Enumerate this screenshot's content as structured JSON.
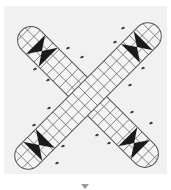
{
  "board": {
    "type": "cross-shaped race board",
    "background_color": "#f1f1f1",
    "grid_line_color": "#6b6b6b",
    "mark_color": "#1a1a1a",
    "arms": [
      {
        "name": "diagonal-tl-br",
        "cx": 88,
        "cy": 97,
        "angle": 45,
        "length": 188,
        "width": 27,
        "rows": 3,
        "cells_per_row": 20
      },
      {
        "name": "diagonal-tr-bl",
        "cx": 88,
        "cy": 96,
        "angle": -45,
        "length": 196,
        "width": 27,
        "rows": 3,
        "cells_per_row": 21
      }
    ],
    "hourglass_markers": [
      {
        "arm": 0,
        "position": "top-left-end"
      },
      {
        "arm": 0,
        "position": "bottom-right-end"
      },
      {
        "arm": 1,
        "position": "top-right-end"
      },
      {
        "arm": 1,
        "position": "bottom-left-end"
      }
    ],
    "scattered_marks": [
      [
        123,
        28
      ],
      [
        68,
        48
      ],
      [
        115,
        42
      ],
      [
        82,
        57
      ],
      [
        35,
        69
      ],
      [
        48,
        80
      ],
      [
        130,
        85
      ],
      [
        143,
        68
      ],
      [
        49,
        108
      ],
      [
        132,
        112
      ],
      [
        151,
        123
      ],
      [
        97,
        135
      ],
      [
        109,
        143
      ],
      [
        34,
        125
      ],
      [
        63,
        146
      ],
      [
        57,
        163
      ]
    ]
  },
  "footer": {
    "expand_icon": "chevron-down-icon"
  }
}
